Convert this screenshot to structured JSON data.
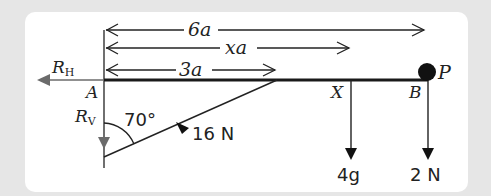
{
  "diagram": {
    "type": "mechanics_free_body",
    "dimensions": {
      "full_length": "6a",
      "x_length": "xa",
      "strut_point": "3a"
    },
    "points": {
      "A": "A",
      "X": "X",
      "B": "B",
      "P": "P"
    },
    "reactions": {
      "horizontal": "R",
      "horizontal_sub": "H",
      "vertical": "R",
      "vertical_sub": "V"
    },
    "strut": {
      "angle": "70°",
      "force": "16 N"
    },
    "loads": {
      "at_X": "4g",
      "at_B": "2 N"
    },
    "colors": {
      "line": "#1a1a1a",
      "reaction_arrow": "#6b6b6b",
      "panel_bg": "#ffffff",
      "outer_bg": "#e6e6e6"
    }
  }
}
